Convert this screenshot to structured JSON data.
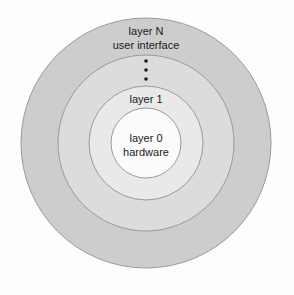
{
  "diagram": {
    "background_color": "#fdfdfd",
    "stroke_color": "#9a9a9a",
    "text_color": "#1a1a1a",
    "center": {
      "x": 146,
      "y": 143
    },
    "rings": [
      {
        "name": "layer-n",
        "radius": 125,
        "fill": "#cdcdcd",
        "label_line_1": "layer N",
        "label_line_2": "user interface",
        "label_x": 146,
        "label_y_1": 32,
        "label_y_2": 46
      },
      {
        "name": "layer-intermediate-outer",
        "radius": 88,
        "fill": "#dcdcdc",
        "label_line_1": "",
        "label_line_2": "",
        "label_x": 146,
        "label_y_1": 0,
        "label_y_2": 0
      },
      {
        "name": "layer-1",
        "radius": 57,
        "fill": "#e9e9e9",
        "label_line_1": "layer 1",
        "label_line_2": "",
        "label_x": 146,
        "label_y_1": 100,
        "label_y_2": 0
      },
      {
        "name": "layer-0",
        "radius": 35,
        "fill": "#fbfbfb",
        "label_line_1": "layer 0",
        "label_line_2": "hardware",
        "label_x": 146,
        "label_y_1": 139,
        "label_y_2": 153
      }
    ],
    "ellipsis": {
      "name": "vertical-ellipsis",
      "x": 146,
      "dot_radius": 1.8,
      "dots_y": [
        61,
        70,
        79
      ],
      "color": "#1a1a1a"
    }
  }
}
